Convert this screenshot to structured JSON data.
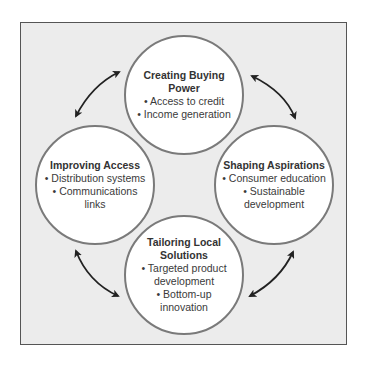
{
  "diagram": {
    "type": "cycle",
    "colors": {
      "background": "#ececec",
      "circle_fill": "#ffffff",
      "circle_border": "#7a7a7a",
      "frame_border": "#555555",
      "arrow": "#222222"
    },
    "nodes": [
      {
        "id": "top",
        "title": "Creating Buying Power",
        "items": [
          "• Access to credit",
          "• Income generation"
        ]
      },
      {
        "id": "right",
        "title": "Shaping Aspirations",
        "items": [
          "• Consumer education",
          "• Sustainable development"
        ]
      },
      {
        "id": "bottom",
        "title": "Tailoring Local Solutions",
        "items": [
          "• Targeted product development",
          "• Bottom-up innovation"
        ]
      },
      {
        "id": "left",
        "title": "Improving Access",
        "items": [
          "• Distribution systems",
          "• Communications links"
        ]
      }
    ],
    "connections": [
      {
        "from": "top",
        "to": "right",
        "arrow": "double-headed"
      },
      {
        "from": "right",
        "to": "bottom",
        "arrow": "double-headed"
      },
      {
        "from": "bottom",
        "to": "left",
        "arrow": "double-headed"
      },
      {
        "from": "left",
        "to": "top",
        "arrow": "double-headed"
      }
    ]
  }
}
